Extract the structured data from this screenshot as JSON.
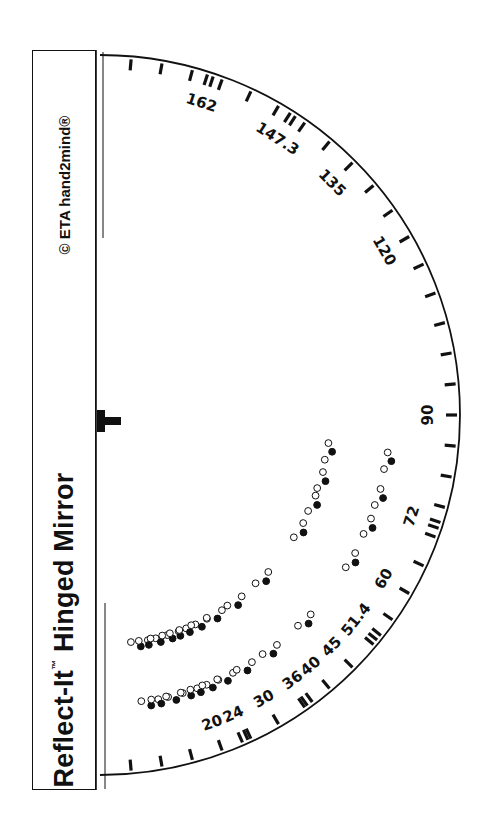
{
  "title": {
    "product_name": "Reflect-It",
    "trademark": "™",
    "subtitle": "Hinged Mirror",
    "full": "Reflect-It™ Hinged Mirror",
    "copyright": "© ETA hand2mind®"
  },
  "protractor": {
    "center": [
      100,
      415
    ],
    "radius": 360,
    "hinge_marker": "T",
    "angle_labels": [
      "20",
      "24",
      "30",
      "36",
      "40",
      "45",
      "51.4",
      "60",
      "72",
      "90",
      "120",
      "135",
      "147.3",
      "162"
    ],
    "label_angles_deg": [
      20,
      24,
      30,
      36,
      40,
      45,
      51.4,
      60,
      72,
      90,
      120,
      135,
      147.3,
      162
    ],
    "double_tick_angles_deg": [
      24,
      36,
      51.4,
      72,
      147.3,
      162
    ]
  },
  "dot_legend": {
    "filled": "object position",
    "hollow": "reflected image positions"
  },
  "colors": {
    "ink": "#111111",
    "background": "#ffffff"
  }
}
